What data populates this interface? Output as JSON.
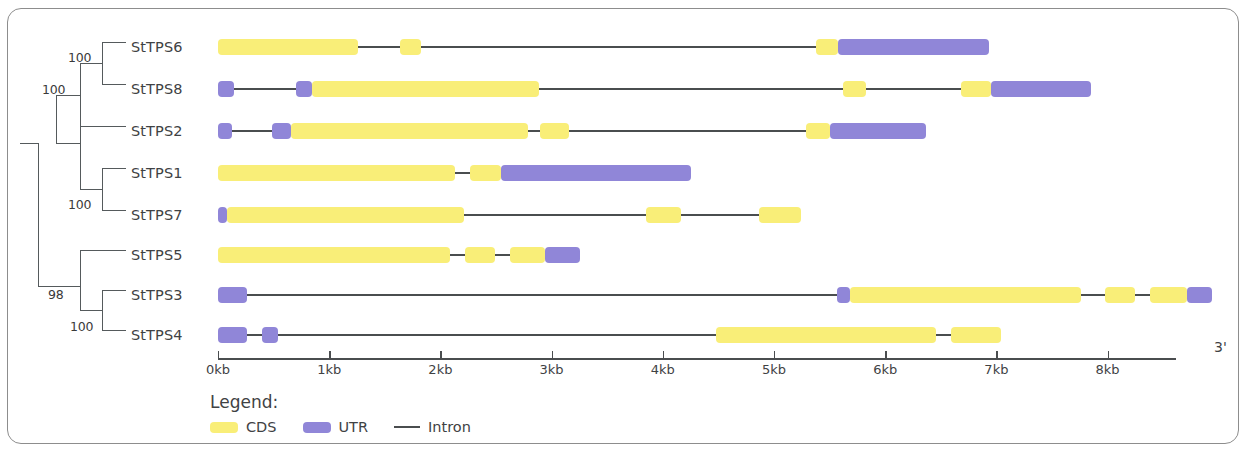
{
  "figure": {
    "type": "gene-structure-diagram",
    "axis_end_label": "3'"
  },
  "tree": {
    "bootstrap_values": [
      {
        "value": "100",
        "x": 68,
        "y": 50
      },
      {
        "value": "100",
        "x": 42,
        "y": 82
      },
      {
        "value": "100",
        "x": 68,
        "y": 197
      },
      {
        "value": "98",
        "x": 48,
        "y": 287
      },
      {
        "value": "100",
        "x": 70,
        "y": 319
      }
    ]
  },
  "genes": [
    {
      "name": "StTPS6",
      "row_y": 36,
      "features": [
        {
          "kind": "cds",
          "start_kb": 0.0,
          "end_kb": 1.255
        },
        {
          "kind": "intron",
          "start_kb": 1.255,
          "end_kb": 1.64
        },
        {
          "kind": "cds",
          "start_kb": 1.64,
          "end_kb": 1.83
        },
        {
          "kind": "intron",
          "start_kb": 1.83,
          "end_kb": 5.375
        },
        {
          "kind": "cds",
          "start_kb": 5.375,
          "end_kb": 5.58
        },
        {
          "kind": "utr",
          "start_kb": 5.58,
          "end_kb": 6.93
        }
      ]
    },
    {
      "name": "StTPS8",
      "row_y": 78,
      "features": [
        {
          "kind": "utr",
          "start_kb": 0.0,
          "end_kb": 0.145
        },
        {
          "kind": "intron",
          "start_kb": 0.145,
          "end_kb": 0.7
        },
        {
          "kind": "utr",
          "start_kb": 0.7,
          "end_kb": 0.845
        },
        {
          "kind": "cds",
          "start_kb": 0.845,
          "end_kb": 2.89
        },
        {
          "kind": "intron",
          "start_kb": 2.89,
          "end_kb": 5.62
        },
        {
          "kind": "cds",
          "start_kb": 5.62,
          "end_kb": 5.83
        },
        {
          "kind": "intron",
          "start_kb": 5.83,
          "end_kb": 6.68
        },
        {
          "kind": "cds",
          "start_kb": 6.68,
          "end_kb": 6.95
        },
        {
          "kind": "utr",
          "start_kb": 6.95,
          "end_kb": 7.855
        }
      ]
    },
    {
      "name": "StTPS2",
      "row_y": 120,
      "features": [
        {
          "kind": "utr",
          "start_kb": 0.0,
          "end_kb": 0.13
        },
        {
          "kind": "intron",
          "start_kb": 0.13,
          "end_kb": 0.485
        },
        {
          "kind": "utr",
          "start_kb": 0.485,
          "end_kb": 0.655
        },
        {
          "kind": "cds",
          "start_kb": 0.655,
          "end_kb": 2.79
        },
        {
          "kind": "intron",
          "start_kb": 2.79,
          "end_kb": 2.9
        },
        {
          "kind": "cds",
          "start_kb": 2.9,
          "end_kb": 3.16
        },
        {
          "kind": "intron",
          "start_kb": 3.16,
          "end_kb": 5.29
        },
        {
          "kind": "cds",
          "start_kb": 5.29,
          "end_kb": 5.5
        },
        {
          "kind": "utr",
          "start_kb": 5.5,
          "end_kb": 6.37
        }
      ]
    },
    {
      "name": "StTPS1",
      "row_y": 162,
      "features": [
        {
          "kind": "cds",
          "start_kb": 0.0,
          "end_kb": 2.135
        },
        {
          "kind": "intron",
          "start_kb": 2.135,
          "end_kb": 2.27
        },
        {
          "kind": "cds",
          "start_kb": 2.27,
          "end_kb": 2.545
        },
        {
          "kind": "utr",
          "start_kb": 2.545,
          "end_kb": 4.255
        }
      ]
    },
    {
      "name": "StTPS7",
      "row_y": 204,
      "features": [
        {
          "kind": "utr",
          "start_kb": 0.0,
          "end_kb": 0.085
        },
        {
          "kind": "cds",
          "start_kb": 0.085,
          "end_kb": 2.21
        },
        {
          "kind": "intron",
          "start_kb": 2.21,
          "end_kb": 3.845
        },
        {
          "kind": "cds",
          "start_kb": 3.845,
          "end_kb": 4.16
        },
        {
          "kind": "intron",
          "start_kb": 4.16,
          "end_kb": 4.865
        },
        {
          "kind": "cds",
          "start_kb": 4.865,
          "end_kb": 5.245
        }
      ]
    },
    {
      "name": "StTPS5",
      "row_y": 244,
      "features": [
        {
          "kind": "cds",
          "start_kb": 0.0,
          "end_kb": 2.09
        },
        {
          "kind": "intron",
          "start_kb": 2.09,
          "end_kb": 2.225
        },
        {
          "kind": "cds",
          "start_kb": 2.225,
          "end_kb": 2.495
        },
        {
          "kind": "intron",
          "start_kb": 2.495,
          "end_kb": 2.63
        },
        {
          "kind": "cds",
          "start_kb": 2.63,
          "end_kb": 2.945
        },
        {
          "kind": "utr",
          "start_kb": 2.945,
          "end_kb": 3.26
        }
      ]
    },
    {
      "name": "StTPS3",
      "row_y": 284,
      "features": [
        {
          "kind": "utr",
          "start_kb": 0.0,
          "end_kb": 0.265
        },
        {
          "kind": "intron",
          "start_kb": 0.265,
          "end_kb": 5.57
        },
        {
          "kind": "utr",
          "start_kb": 5.57,
          "end_kb": 5.68
        },
        {
          "kind": "cds",
          "start_kb": 5.68,
          "end_kb": 7.765
        },
        {
          "kind": "intron",
          "start_kb": 7.765,
          "end_kb": 7.975
        },
        {
          "kind": "cds",
          "start_kb": 7.975,
          "end_kb": 8.245
        },
        {
          "kind": "intron",
          "start_kb": 8.245,
          "end_kb": 8.38
        },
        {
          "kind": "cds",
          "start_kb": 8.38,
          "end_kb": 8.71
        },
        {
          "kind": "utr",
          "start_kb": 8.71,
          "end_kb": 8.935
        }
      ]
    },
    {
      "name": "StTPS4",
      "row_y": 324,
      "features": [
        {
          "kind": "utr",
          "start_kb": 0.0,
          "end_kb": 0.265
        },
        {
          "kind": "intron",
          "start_kb": 0.265,
          "end_kb": 0.4
        },
        {
          "kind": "utr",
          "start_kb": 0.4,
          "end_kb": 0.54
        },
        {
          "kind": "intron",
          "start_kb": 0.54,
          "end_kb": 4.475
        },
        {
          "kind": "cds",
          "start_kb": 4.475,
          "end_kb": 6.455
        },
        {
          "kind": "intron",
          "start_kb": 6.455,
          "end_kb": 6.59
        },
        {
          "kind": "cds",
          "start_kb": 6.59,
          "end_kb": 7.04
        }
      ]
    }
  ],
  "axis": {
    "origin_px": 218,
    "px_per_kb": 111.2,
    "ticks": [
      {
        "label": "0kb",
        "kb": 0
      },
      {
        "label": "1kb",
        "kb": 1
      },
      {
        "label": "2kb",
        "kb": 2
      },
      {
        "label": "3kb",
        "kb": 3
      },
      {
        "label": "4kb",
        "kb": 4
      },
      {
        "label": "5kb",
        "kb": 5
      },
      {
        "label": "6kb",
        "kb": 6
      },
      {
        "label": "7kb",
        "kb": 7
      },
      {
        "label": "8kb",
        "kb": 8
      }
    ]
  },
  "legend": {
    "title": "Legend:",
    "items": [
      {
        "label": "CDS",
        "kind": "cds",
        "color": "#f9ee78"
      },
      {
        "label": "UTR",
        "kind": "utr",
        "color": "#9086d8"
      },
      {
        "label": "Intron",
        "kind": "intron",
        "color": "#4a4d4f"
      }
    ]
  },
  "colors": {
    "cds": "#f9ee78",
    "utr": "#9086d8",
    "intron": "#4a4d4f",
    "tree": "#555a5c",
    "text": "#3f4244",
    "frame": "#8d8d8d"
  }
}
